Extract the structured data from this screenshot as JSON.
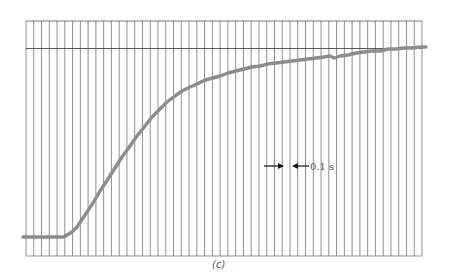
{
  "chart_data": {
    "type": "line",
    "title": "",
    "xlabel": "",
    "ylabel": "",
    "caption": "(c)",
    "grid": {
      "vertical": true,
      "horizontal": false,
      "vertical_line_count": 52,
      "vertical_spacing_label": "0.1 s"
    },
    "reference_line": {
      "description": "final steady-state level",
      "y_fraction": 0.0
    },
    "annotation": {
      "text": "0.1 s",
      "meaning": "spacing between adjacent vertical grid lines"
    },
    "x_unit": "s",
    "x_per_division": 0.1,
    "series": [
      {
        "name": "step response",
        "color": "#8c8c8c",
        "description": "normalized response rising from initial level (0) to final level (1); time in seconds from left edge of grid",
        "x": [
          0.0,
          0.05,
          0.06,
          0.07,
          0.08,
          0.1,
          0.12,
          0.14,
          0.16,
          0.18,
          0.2,
          0.24,
          0.28,
          0.32,
          0.36,
          0.4,
          0.44,
          0.48,
          0.52,
          0.56,
          0.6,
          0.64,
          0.68,
          0.72,
          0.76,
          0.8,
          0.84,
          0.88,
          0.92,
          0.96,
          1.0,
          1.04,
          1.08,
          1.12,
          1.16,
          1.2,
          1.24,
          1.28,
          1.32,
          1.36,
          1.4,
          1.44,
          1.48,
          1.52,
          1.56,
          1.6,
          1.64,
          1.68,
          1.72,
          1.76,
          1.8,
          1.84,
          1.88,
          1.92,
          1.96,
          2.0,
          2.04,
          2.08,
          2.12,
          2.16,
          2.2,
          2.24,
          2.28,
          2.32,
          2.36,
          2.4,
          2.44,
          2.48,
          2.52,
          2.56,
          2.6,
          2.64,
          2.68,
          2.72,
          2.76,
          2.8,
          2.84,
          2.88,
          2.92,
          2.96,
          3.0,
          3.04,
          3.08,
          3.12,
          3.16,
          3.2,
          3.24,
          3.28,
          3.32,
          3.36,
          3.4,
          3.44,
          3.48,
          3.52,
          3.56,
          3.6,
          3.64,
          3.68,
          3.72,
          3.76,
          3.8,
          3.84,
          3.88,
          3.92,
          3.96,
          4.0,
          4.04,
          4.08,
          4.12,
          4.16,
          4.2,
          4.24,
          4.28,
          4.32,
          4.36,
          4.4,
          4.44,
          4.48,
          4.52,
          4.56,
          4.6,
          4.64,
          4.68,
          4.72,
          4.76,
          4.8,
          4.84,
          4.88,
          4.92,
          4.96,
          5.0,
          5.04,
          5.08,
          5.1
        ],
        "points_px": [
          [
            23,
            237
          ],
          [
            64,
            237
          ],
          [
            67,
            235
          ],
          [
            72,
            232
          ],
          [
            77,
            227
          ],
          [
            85,
            215
          ],
          [
            93,
            203
          ],
          [
            100,
            191
          ],
          [
            108,
            179
          ],
          [
            115,
            168
          ],
          [
            122,
            157
          ],
          [
            130,
            146
          ],
          [
            137,
            136
          ],
          [
            145,
            126
          ],
          [
            152,
            117
          ],
          [
            160,
            109
          ],
          [
            167,
            102
          ],
          [
            175,
            96
          ],
          [
            182,
            91
          ],
          [
            190,
            87
          ],
          [
            197,
            84
          ],
          [
            205,
            80
          ],
          [
            213,
            78
          ],
          [
            220,
            76
          ],
          [
            228,
            73
          ],
          [
            236,
            71
          ],
          [
            244,
            69
          ],
          [
            252,
            67
          ],
          [
            260,
            66
          ],
          [
            268,
            64
          ],
          [
            276,
            63
          ],
          [
            284,
            62
          ],
          [
            292,
            61
          ],
          [
            300,
            60
          ],
          [
            308,
            59
          ],
          [
            316,
            58
          ],
          [
            324,
            57
          ],
          [
            330,
            56
          ],
          [
            334,
            58
          ],
          [
            340,
            56
          ],
          [
            348,
            55
          ],
          [
            356,
            53
          ],
          [
            364,
            52
          ],
          [
            372,
            51
          ],
          [
            380,
            51
          ],
          [
            388,
            49
          ],
          [
            396,
            49
          ],
          [
            404,
            48
          ],
          [
            412,
            48
          ],
          [
            420,
            47
          ],
          [
            426,
            47
          ]
        ]
      }
    ],
    "ylim": [
      0,
      1
    ]
  }
}
